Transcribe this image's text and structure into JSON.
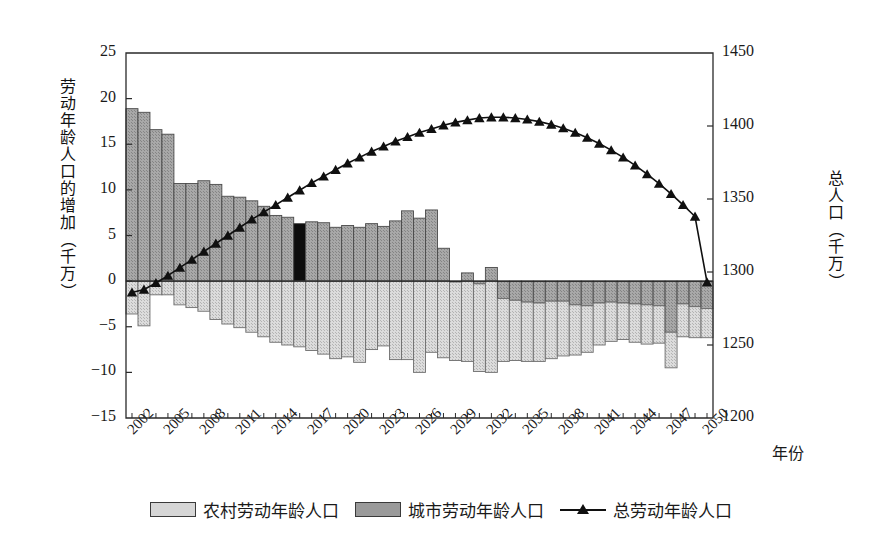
{
  "chart_data": {
    "type": "bar",
    "title": "",
    "xlabel": "年份",
    "ylabel": "劳动年龄人口的增加（千万）",
    "ylabel_secondary": "总人口（千万）",
    "ylim": [
      -15,
      25
    ],
    "ylim_secondary": [
      1200,
      1450
    ],
    "ytick_labels": [
      "25",
      "20",
      "15",
      "10",
      "5",
      "0",
      "-5",
      "-10",
      "-15"
    ],
    "ytick_values": [
      25,
      20,
      15,
      10,
      5,
      0,
      -5,
      -10,
      -15
    ],
    "ytick_labels_secondary": [
      "1450",
      "1400",
      "1350",
      "1300",
      "1250",
      "1200"
    ],
    "ytick_values_secondary": [
      1450,
      1400,
      1350,
      1300,
      1250,
      1200
    ],
    "xtick_labels": [
      "2002",
      "2005",
      "2008",
      "2011",
      "2014",
      "2017",
      "2020",
      "2023",
      "2026",
      "2029",
      "2032",
      "2035",
      "2038",
      "2041",
      "2044",
      "2047",
      "2050"
    ],
    "grid": false,
    "legend_position": "bottom",
    "categories": [
      2002,
      2003,
      2004,
      2005,
      2006,
      2007,
      2008,
      2009,
      2010,
      2011,
      2012,
      2013,
      2014,
      2015,
      2016,
      2017,
      2018,
      2019,
      2020,
      2021,
      2022,
      2023,
      2024,
      2025,
      2026,
      2027,
      2028,
      2029,
      2030,
      2031,
      2032,
      2033,
      2034,
      2035,
      2036,
      2037,
      2038,
      2039,
      2040,
      2041,
      2042,
      2043,
      2044,
      2045,
      2046,
      2047,
      2048,
      2049,
      2050
    ],
    "series": [
      {
        "name": "城市劳动年龄人口",
        "axis": "left",
        "color": "#9a9a9a",
        "values": [
          18.9,
          18.5,
          16.6,
          16.1,
          10.7,
          10.7,
          11.0,
          10.6,
          9.3,
          9.2,
          8.8,
          8.2,
          7.2,
          7.0,
          6.3,
          6.5,
          6.4,
          5.9,
          6.1,
          5.9,
          6.3,
          6.0,
          6.6,
          7.7,
          6.9,
          7.8,
          3.6,
          -0.1,
          0.9,
          -0.3,
          1.5,
          -1.9,
          -2.1,
          -2.3,
          -2.4,
          -2.2,
          -2.2,
          -2.6,
          -2.7,
          -2.4,
          -2.3,
          -2.4,
          -2.5,
          -2.6,
          -2.7,
          -5.6,
          -2.5,
          -2.8,
          -3.0
        ]
      },
      {
        "name": "农村劳动年龄人口",
        "axis": "left",
        "color": "#d2d2d2",
        "values": [
          -3.6,
          -4.9,
          -1.5,
          -1.5,
          -2.6,
          -2.9,
          -3.3,
          -4.2,
          -4.7,
          -5.1,
          -5.6,
          -6.1,
          -6.7,
          -7.0,
          -7.2,
          -7.6,
          -8.0,
          -8.5,
          -8.3,
          -8.9,
          -7.5,
          -7.1,
          -8.6,
          -8.6,
          -10.0,
          -7.8,
          -8.4,
          -8.6,
          -8.8,
          -9.6,
          -10.0,
          -6.9,
          -6.6,
          -6.5,
          -6.4,
          -6.3,
          -6.0,
          -5.5,
          -5.1,
          -4.6,
          -4.3,
          -4.0,
          -4.2,
          -4.3,
          -4.1,
          -3.9,
          -3.6,
          -3.4,
          -3.2
        ]
      },
      {
        "name": "总劳动年龄人口",
        "axis": "right",
        "color": "#101010",
        "marker": "triangle",
        "values": [
          1286.0,
          1288.0,
          1292.5,
          1297.5,
          1303.0,
          1308.5,
          1314.0,
          1319.5,
          1325.0,
          1330.5,
          1336.0,
          1341.0,
          1346.0,
          1351.0,
          1356.0,
          1361.0,
          1365.5,
          1370.0,
          1374.5,
          1378.5,
          1382.5,
          1386.0,
          1389.5,
          1392.5,
          1395.5,
          1398.0,
          1400.5,
          1402.5,
          1404.0,
          1405.5,
          1406.0,
          1406.0,
          1405.5,
          1404.5,
          1403.0,
          1401.0,
          1398.5,
          1395.5,
          1392.0,
          1388.0,
          1383.5,
          1378.5,
          1373.0,
          1367.0,
          1360.5,
          1353.5,
          1346.0,
          1338.0,
          1293.0
        ]
      }
    ],
    "highlight": {
      "year": 2016,
      "color": "#0d0d0d",
      "note": "黑色高亮柱"
    }
  },
  "axes": {
    "left_title_chars": [
      "劳",
      "动",
      "年",
      "龄",
      "人",
      "口",
      "的",
      "增",
      "加",
      "（",
      "千",
      "万",
      "）"
    ],
    "right_title_chars": [
      "总",
      "人",
      "口",
      "（",
      "千",
      "万",
      "）"
    ],
    "x_title": "年份"
  },
  "legend": {
    "items": [
      {
        "label": "农村劳动年龄人口",
        "kind": "swatch",
        "color": "#d6d6d6"
      },
      {
        "label": "城市劳动年龄人口",
        "kind": "swatch",
        "color": "#9a9a9a"
      },
      {
        "label": "总劳动年龄人口",
        "kind": "line",
        "color": "#101010"
      }
    ]
  }
}
